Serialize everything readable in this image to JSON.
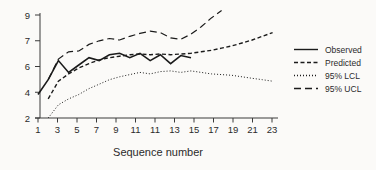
{
  "chart_data": {
    "type": "line",
    "xlabel": "Sequence number",
    "ylabel": "",
    "x_tick_labels": [
      "1",
      "3",
      "5",
      "7",
      "9",
      "11",
      "11",
      "13",
      "15",
      "17",
      "19",
      "21",
      "23"
    ],
    "y_tick_labels": [
      "9",
      "7",
      "6",
      "4",
      "2"
    ],
    "y_axis_underlying_range": [
      2,
      9
    ],
    "x_axis_note": "sequence numbers 1-24, ticks at every other position",
    "grid": "off",
    "legend_position": "right",
    "line_color": "#1b1b1b",
    "series": [
      {
        "name": "Observed",
        "style": "solid",
        "dash": "none",
        "stroke_width": 1.6,
        "start_seq": 1,
        "values": [
          3.6,
          4.6,
          5.9,
          5.1,
          5.6,
          6.1,
          5.9,
          6.3,
          6.4,
          6.1,
          6.4,
          5.9,
          6.3,
          5.7,
          6.25,
          6.1
        ]
      },
      {
        "name": "Predicted",
        "style": "short-dash",
        "dash": "4 2.5",
        "stroke_width": 1.4,
        "start_seq": 2,
        "values": [
          3.3,
          4.5,
          5.0,
          5.4,
          5.7,
          5.95,
          6.1,
          6.2,
          6.3,
          6.35,
          6.3,
          6.35,
          6.3,
          6.35,
          6.4,
          6.5,
          6.6,
          6.75,
          6.9,
          7.1,
          7.3,
          7.55,
          7.8
        ]
      },
      {
        "name": "95% LCL",
        "style": "dotted",
        "dash": "1 2",
        "stroke_width": 1,
        "start_seq": 2,
        "values": [
          2.0,
          2.9,
          3.3,
          3.6,
          4.0,
          4.3,
          4.6,
          4.8,
          4.95,
          5.1,
          5.0,
          5.15,
          5.2,
          5.1,
          5.2,
          5.1,
          5.0,
          4.95,
          4.9,
          4.8,
          4.7,
          4.6,
          4.5
        ]
      },
      {
        "name": "95% UCL",
        "style": "long-dash",
        "dash": "7 4",
        "stroke_width": 1.2,
        "start_seq": 2,
        "values": [
          4.6,
          6.0,
          6.5,
          6.55,
          7.0,
          7.25,
          7.4,
          7.3,
          7.55,
          7.75,
          7.9,
          7.8,
          7.45,
          7.35,
          7.7,
          8.2,
          8.8,
          9.3
        ]
      }
    ]
  },
  "colors": {
    "background": "#fbfaf8",
    "line": "#1b1b1b",
    "text": "#2b2b2b"
  }
}
